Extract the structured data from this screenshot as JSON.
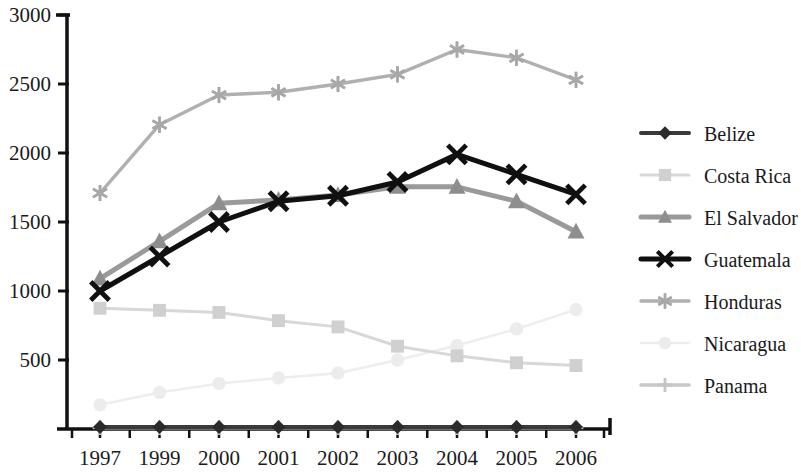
{
  "chart_data": {
    "type": "line",
    "title": "",
    "subtitle": "",
    "xlabel": "",
    "ylabel": "",
    "categories": [
      "1997",
      "1999",
      "2000",
      "2001",
      "2002",
      "2003",
      "2004",
      "2005",
      "2006"
    ],
    "x": [
      "1997",
      "1999",
      "2000",
      "2001",
      "2002",
      "2003",
      "2004",
      "2005",
      "2006"
    ],
    "ylim": [
      0,
      3000
    ],
    "yticks": [
      0,
      500,
      1000,
      1500,
      2000,
      2500,
      3000
    ],
    "ytick_labels": [
      "",
      "500",
      "1000",
      "1500",
      "2000",
      "2500",
      "3000"
    ],
    "grid": false,
    "legend_position": "right",
    "series": [
      {
        "name": "Belize",
        "marker": "diamond",
        "color": "#2b2b2b",
        "line_color": "#3a3a3a",
        "values": [
          15,
          15,
          15,
          15,
          15,
          15,
          15,
          15,
          15
        ]
      },
      {
        "name": "Costa Rica",
        "marker": "square",
        "color": "#d0d0d0",
        "line_color": "#d8d8d8",
        "values": [
          875,
          860,
          845,
          785,
          740,
          600,
          530,
          480,
          460
        ]
      },
      {
        "name": "El Salvador",
        "marker": "triangle",
        "color": "#8e8e8e",
        "line_color": "#9a9a9a",
        "values": [
          1090,
          1360,
          1635,
          1660,
          1695,
          1755,
          1755,
          1650,
          1430
        ]
      },
      {
        "name": "Guatemala",
        "marker": "x",
        "color": "#101010",
        "line_color": "#101010",
        "values": [
          1000,
          1250,
          1500,
          1650,
          1690,
          1790,
          1990,
          1845,
          1700
        ]
      },
      {
        "name": "Honduras",
        "marker": "asterisk",
        "color": "#a8a8a8",
        "line_color": "#b0b0b0",
        "values": [
          1710,
          2205,
          2420,
          2440,
          2500,
          2570,
          2750,
          2690,
          2530
        ]
      },
      {
        "name": "Nicaragua",
        "marker": "circle",
        "color": "#ececec",
        "line_color": "#eeeeee",
        "values": [
          175,
          265,
          330,
          370,
          405,
          500,
          605,
          725,
          865
        ]
      },
      {
        "name": "Panama",
        "marker": "plus",
        "color": "#c4c4c4",
        "line_color": "#c8c8c8",
        "values": [
          10,
          10,
          10,
          10,
          10,
          10,
          10,
          10,
          10
        ]
      }
    ]
  },
  "legend": {
    "entries": [
      {
        "label": "Belize"
      },
      {
        "label": "Costa Rica"
      },
      {
        "label": "El Salvador"
      },
      {
        "label": "Guatemala"
      },
      {
        "label": "Honduras"
      },
      {
        "label": "Nicaragua"
      },
      {
        "label": "Panama"
      }
    ]
  },
  "axes": {
    "y_axis_color": "#111111",
    "x_axis_color": "#111111"
  }
}
